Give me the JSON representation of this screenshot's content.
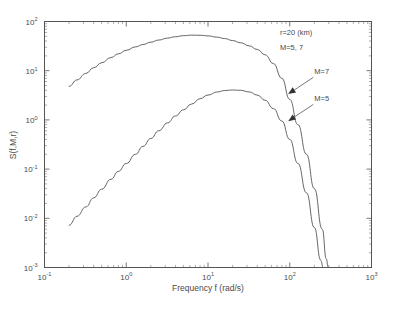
{
  "chart_data": {
    "type": "line",
    "title": "",
    "xlabel": "Frequency f (rad/s)",
    "ylabel": "S(f,M,r)",
    "xscale": "log",
    "yscale": "log",
    "xlim": [
      0.1,
      1000
    ],
    "ylim": [
      0.001,
      100
    ],
    "grid": false,
    "legend_position": "inline-annotations",
    "xticks": [
      {
        "value": 0.1,
        "base": "10",
        "exp": "-1"
      },
      {
        "value": 1,
        "base": "10",
        "exp": "0"
      },
      {
        "value": 10,
        "base": "10",
        "exp": "1"
      },
      {
        "value": 100,
        "base": "10",
        "exp": "2"
      },
      {
        "value": 1000,
        "base": "10",
        "exp": "3"
      }
    ],
    "yticks": [
      {
        "value": 100,
        "base": "10",
        "exp": "2"
      },
      {
        "value": 10,
        "base": "10",
        "exp": "1"
      },
      {
        "value": 1,
        "base": "10",
        "exp": "0"
      },
      {
        "value": 0.1,
        "base": "10",
        "exp": "-1"
      },
      {
        "value": 0.01,
        "base": "10",
        "exp": "-2"
      },
      {
        "value": 0.001,
        "base": "10",
        "exp": "-3"
      }
    ],
    "annotations": [
      {
        "text": "r=20 (km)",
        "x_frac": 0.72,
        "y_frac": 0.055
      },
      {
        "text": "M=5, 7",
        "x_frac": 0.72,
        "y_frac": 0.115
      }
    ],
    "series": [
      {
        "name": "M=7",
        "label": "M=7",
        "points": [
          [
            0.2,
            4.8
          ],
          [
            0.25,
            6.5
          ],
          [
            0.32,
            8.8
          ],
          [
            0.4,
            11.5
          ],
          [
            0.5,
            14.5
          ],
          [
            0.65,
            18.5
          ],
          [
            0.8,
            22.0
          ],
          [
            1.0,
            26.0
          ],
          [
            1.3,
            30.5
          ],
          [
            1.6,
            34.0
          ],
          [
            2.0,
            38.0
          ],
          [
            2.5,
            42.0
          ],
          [
            3.2,
            46.0
          ],
          [
            4.0,
            49.0
          ],
          [
            5.0,
            51.5
          ],
          [
            6.3,
            52.8
          ],
          [
            8.0,
            52.5
          ],
          [
            10.0,
            51.0
          ],
          [
            13.0,
            48.0
          ],
          [
            16.0,
            45.0
          ],
          [
            20.0,
            41.0
          ],
          [
            25.0,
            37.0
          ],
          [
            32.0,
            32.0
          ],
          [
            40.0,
            27.0
          ],
          [
            50.0,
            21.0
          ],
          [
            63.0,
            14.0
          ],
          [
            80.0,
            7.0
          ],
          [
            100.0,
            2.6
          ],
          [
            126.0,
            0.8
          ],
          [
            160.0,
            0.2
          ],
          [
            200.0,
            0.04
          ],
          [
            250.0,
            0.006
          ],
          [
            280.0,
            0.0015
          ],
          [
            295.0,
            0.001
          ]
        ]
      },
      {
        "name": "M=5",
        "label": "M=5",
        "points": [
          [
            0.2,
            0.0072
          ],
          [
            0.25,
            0.011
          ],
          [
            0.32,
            0.017
          ],
          [
            0.4,
            0.026
          ],
          [
            0.5,
            0.039
          ],
          [
            0.65,
            0.062
          ],
          [
            0.8,
            0.09
          ],
          [
            1.0,
            0.13
          ],
          [
            1.3,
            0.2
          ],
          [
            1.6,
            0.29
          ],
          [
            2.0,
            0.42
          ],
          [
            2.5,
            0.6
          ],
          [
            3.2,
            0.87
          ],
          [
            4.0,
            1.2
          ],
          [
            5.0,
            1.6
          ],
          [
            6.3,
            2.1
          ],
          [
            8.0,
            2.7
          ],
          [
            10.0,
            3.2
          ],
          [
            13.0,
            3.7
          ],
          [
            16.0,
            3.95
          ],
          [
            20.0,
            4.05
          ],
          [
            25.0,
            4.0
          ],
          [
            32.0,
            3.7
          ],
          [
            40.0,
            3.2
          ],
          [
            50.0,
            2.5
          ],
          [
            63.0,
            1.7
          ],
          [
            80.0,
            0.95
          ],
          [
            100.0,
            0.4
          ],
          [
            126.0,
            0.13
          ],
          [
            160.0,
            0.033
          ],
          [
            200.0,
            0.0065
          ],
          [
            240.0,
            0.0014
          ],
          [
            255.0,
            0.001
          ]
        ]
      }
    ],
    "series_labels": [
      {
        "text": "M=7",
        "label_x": 0.825,
        "label_y": 0.215,
        "tip_x": 0.745,
        "tip_y": 0.295
      },
      {
        "text": "M=5",
        "label_x": 0.825,
        "label_y": 0.325,
        "tip_x": 0.745,
        "tip_y": 0.405
      }
    ]
  }
}
